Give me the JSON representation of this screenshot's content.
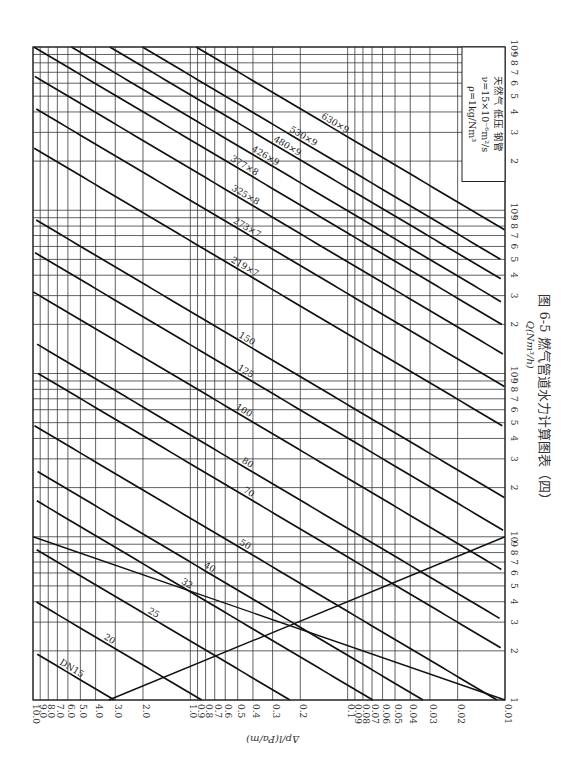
{
  "chart_data": {
    "type": "line",
    "title": "图 6-5  燃气管道水力计算图表（四）",
    "xlabel": "Q(Nm³/h)",
    "ylabel": "Δp/l(Pa/m)",
    "x_scale": "log",
    "y_scale": "log",
    "xlim": [
      1,
      10000
    ],
    "ylim": [
      0.01,
      10
    ],
    "orientation": "rotated-90",
    "grid": true,
    "x_ticks": [
      "1",
      "2",
      "3",
      "4",
      "5",
      "6",
      "7",
      "8",
      "9",
      "10",
      "2",
      "3",
      "4",
      "5",
      "6",
      "7",
      "8",
      "9",
      "10²",
      "2",
      "3",
      "4",
      "5",
      "6",
      "7",
      "8",
      "9",
      "10³",
      "2",
      "3",
      "4",
      "5",
      "6",
      "7",
      "8",
      "9",
      "10⁴"
    ],
    "y_ticks": [
      "10.0",
      "9.0",
      "8.0",
      "7.0",
      "6.0",
      "5.0",
      "4.0",
      "3.0",
      "2.0",
      "1.0",
      "0.9",
      "0.8",
      "0.7",
      "0.6",
      "0.5",
      "0.4",
      "0.3",
      "0.2",
      "0.1",
      "0.09",
      "0.08",
      "0.07",
      "0.06",
      "0.05",
      "0.04",
      "0.03",
      "0.02",
      "0.01"
    ],
    "legend": {
      "position": "top-right",
      "lines": [
        "天然气   低压   钢管",
        "ν=15×10⁻⁶m²/s",
        "ρ=1kg/Nm³"
      ]
    },
    "series": [
      {
        "name": "DN15",
        "q_at_1pa": 0.53
      },
      {
        "name": "20",
        "q_at_1pa": 1.1
      },
      {
        "name": "25",
        "q_at_1pa": 2.3
      },
      {
        "name": "32",
        "q_at_1pa": 4.6
      },
      {
        "name": "40",
        "q_at_1pa": 7.0
      },
      {
        "name": "50",
        "q_at_1pa": 13
      },
      {
        "name": "70",
        "q_at_1pa": 28
      },
      {
        "name": "80",
        "q_at_1pa": 42
      },
      {
        "name": "100",
        "q_at_1pa": 85
      },
      {
        "name": "125",
        "q_at_1pa": 150
      },
      {
        "name": "150",
        "q_at_1pa": 240
      },
      {
        "name": "219×7",
        "q_at_1pa": 650
      },
      {
        "name": "273×7",
        "q_at_1pa": 1150
      },
      {
        "name": "325×8",
        "q_at_1pa": 1800
      },
      {
        "name": "377×8",
        "q_at_1pa": 2700
      },
      {
        "name": "426×9",
        "q_at_1pa": 3700
      },
      {
        "name": "480×9",
        "q_at_1pa": 5100
      },
      {
        "name": "530×9",
        "q_at_1pa": 6700
      },
      {
        "name": "630×9",
        "q_at_1pa": 10500
      }
    ],
    "slope_exponent": 1.75,
    "laminar_boundary": [
      {
        "q": 1.0,
        "dp": 3.3
      },
      {
        "q": 10,
        "dp": 0.01
      }
    ],
    "transition_boundary": [
      {
        "q": 1.0,
        "dp": 0.009
      },
      {
        "q": 10,
        "dp": 10
      }
    ]
  }
}
